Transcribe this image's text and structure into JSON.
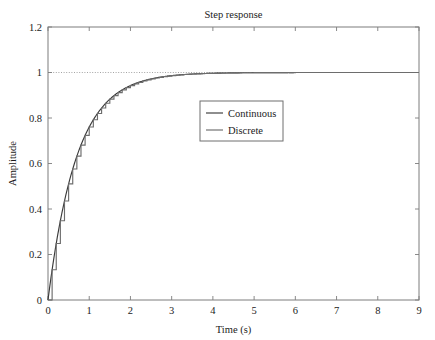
{
  "chart_data": {
    "type": "line",
    "title": "Step response",
    "xlabel": "Time (s)",
    "ylabel": "Amplitude",
    "xlim": [
      0,
      9
    ],
    "ylim": [
      0,
      1.2
    ],
    "xticks": [
      "0",
      "1",
      "2",
      "3",
      "4",
      "5",
      "6",
      "7",
      "8",
      "9"
    ],
    "xtick_values": [
      0,
      1,
      2,
      3,
      4,
      5,
      6,
      7,
      8,
      9
    ],
    "yticks": [
      "0",
      "0.2",
      "0.4",
      "0.6",
      "0.8",
      "1",
      "1.2"
    ],
    "ytick_values": [
      0,
      0.2,
      0.4,
      0.6,
      0.8,
      1,
      1.2
    ],
    "grid": false,
    "reference_line": {
      "axis": "y",
      "value": 1,
      "style": "dotted",
      "color": "#9a9a9a"
    },
    "legend": {
      "position": "center",
      "entries": [
        {
          "name": "Continuous",
          "color": "#3a3a3a",
          "style": "solid"
        },
        {
          "name": "Discrete",
          "color": "#6d6d6d",
          "style": "solid-step"
        }
      ]
    },
    "model": {
      "description": "first-order step response y(t) = 1 - exp(-t/tau)",
      "tau": 0.7,
      "final_value": 1.0,
      "sample_time": 0.1
    },
    "series": [
      {
        "name": "Continuous",
        "color": "#3a3a3a",
        "x": [
          0,
          0.1,
          0.2,
          0.3,
          0.4,
          0.5,
          0.6,
          0.7,
          0.8,
          0.9,
          1.0,
          1.2,
          1.4,
          1.6,
          1.8,
          2.0,
          2.25,
          2.5,
          2.75,
          3.0,
          3.5,
          4.0,
          4.5,
          5.0,
          5.5,
          6.0,
          6.5,
          7.0,
          7.5,
          8.0,
          8.5,
          9.0
        ],
        "values": [
          0,
          0.133,
          0.249,
          0.349,
          0.435,
          0.51,
          0.575,
          0.632,
          0.681,
          0.724,
          0.761,
          0.82,
          0.865,
          0.899,
          0.923,
          0.943,
          0.96,
          0.972,
          0.981,
          0.986,
          0.993,
          0.997,
          0.999,
          0.999,
          1.0,
          1.0,
          1.0,
          1.0,
          1.0,
          1.0,
          1.0,
          1.0
        ]
      },
      {
        "name": "Discrete",
        "color": "#6d6d6d",
        "x": [
          0,
          0.1,
          0.2,
          0.3,
          0.4,
          0.5,
          0.6,
          0.7,
          0.8,
          0.9,
          1.0,
          1.1,
          1.2,
          1.3,
          1.4,
          1.5,
          1.6,
          1.7,
          1.8,
          1.9,
          2.0,
          2.1,
          2.2,
          2.3,
          2.4,
          2.5,
          2.6,
          2.7,
          2.8,
          2.9,
          3.0,
          3.2,
          3.4,
          3.6,
          3.8,
          4.0,
          4.5,
          5.0,
          6.0,
          7.0,
          8.0,
          9.0
        ],
        "values": [
          0,
          0.133,
          0.249,
          0.349,
          0.435,
          0.51,
          0.575,
          0.632,
          0.681,
          0.724,
          0.761,
          0.793,
          0.82,
          0.844,
          0.865,
          0.883,
          0.899,
          0.912,
          0.923,
          0.934,
          0.943,
          0.95,
          0.957,
          0.962,
          0.967,
          0.972,
          0.975,
          0.979,
          0.981,
          0.984,
          0.986,
          0.99,
          0.992,
          0.994,
          0.996,
          0.997,
          0.999,
          0.999,
          1.0,
          1.0,
          1.0,
          1.0
        ]
      }
    ]
  }
}
